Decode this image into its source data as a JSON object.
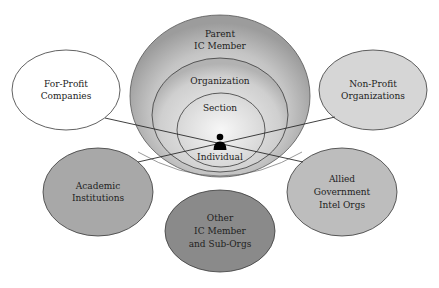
{
  "diagram": {
    "center": {
      "rings": [
        {
          "label_lines": [
            "Parent",
            "IC Member"
          ]
        },
        {
          "label_lines": [
            "Organization"
          ]
        },
        {
          "label_lines": [
            "Section"
          ]
        },
        {
          "label_lines": [
            "Individual"
          ]
        }
      ],
      "person_icon": "person-icon"
    },
    "satellites": [
      {
        "label_lines": [
          "For-Profit",
          "Companies"
        ],
        "fill": "#ffffff"
      },
      {
        "label_lines": [
          "Non-Profit",
          "Organizations"
        ],
        "fill": "#d6d6d6"
      },
      {
        "label_lines": [
          "Academic",
          "Institutions"
        ],
        "fill": "#a8a8a8"
      },
      {
        "label_lines": [
          "Allied",
          "Government",
          "Intel Orgs"
        ],
        "fill": "#bdbdbd"
      },
      {
        "label_lines": [
          "Other",
          "IC Member",
          "and Sub-Orgs"
        ],
        "fill": "#8a8a8a"
      }
    ],
    "colors": {
      "stroke": "#3a3a3a",
      "outer_ring_edge": "#9a9a9a",
      "outer_ring_center": "#f2f2f2"
    }
  }
}
